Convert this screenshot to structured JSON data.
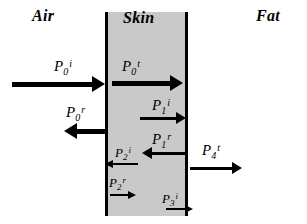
{
  "figure": {
    "background_color": "#ffffff",
    "ink_color": "#000000",
    "slab_fill_color": "#c9c9c9"
  },
  "regions": [
    {
      "id": "air",
      "label": "Air",
      "x": 32,
      "y": 7
    },
    {
      "id": "skin",
      "label": "Skin",
      "x": 123,
      "y": 9
    },
    {
      "id": "fat",
      "label": "Fat",
      "x": 256,
      "y": 7
    }
  ],
  "boundaries": [
    {
      "id": "air-skin",
      "x": 105,
      "top": 12,
      "height": 204,
      "thickness": 3
    },
    {
      "id": "skin-fat",
      "x": 185,
      "top": 12,
      "height": 204,
      "thickness": 3
    }
  ],
  "waves": [
    {
      "id": "p0-incident",
      "base": "P",
      "sub": "0",
      "sup": "i",
      "direction": "right",
      "weight": "thick",
      "arrow": {
        "x": 12,
        "y": 84,
        "length": 80
      },
      "label": {
        "x": 54,
        "y": 58
      }
    },
    {
      "id": "p0-transmitted",
      "base": "P",
      "sub": "0",
      "sup": "t",
      "direction": "right",
      "weight": "thick",
      "arrow": {
        "x": 112,
        "y": 83,
        "length": 58
      },
      "label": {
        "x": 122,
        "y": 58
      }
    },
    {
      "id": "p0-reflected",
      "base": "P",
      "sub": "0",
      "sup": "r",
      "direction": "left",
      "weight": "thick",
      "arrow": {
        "x": 77,
        "y": 131,
        "length": 28
      },
      "label": {
        "x": 66,
        "y": 104
      }
    },
    {
      "id": "p1-incident",
      "base": "P",
      "sub": "1",
      "sup": "i",
      "direction": "right",
      "weight": "med",
      "arrow": {
        "x": 140,
        "y": 118,
        "length": 36
      },
      "label": {
        "x": 152,
        "y": 97
      }
    },
    {
      "id": "p1-reflected",
      "base": "P",
      "sub": "1",
      "sup": "r",
      "direction": "left",
      "weight": "med",
      "arrow": {
        "x": 152,
        "y": 153,
        "length": 33
      },
      "label": {
        "x": 152,
        "y": 131
      }
    },
    {
      "id": "p2-incident",
      "base": "P",
      "sub": "2",
      "sup": "i",
      "direction": "left",
      "weight": "thin",
      "arrow": {
        "x": 113,
        "y": 164,
        "length": 25
      },
      "label": {
        "x": 115,
        "y": 144
      }
    },
    {
      "id": "p2-reflected",
      "base": "P",
      "sub": "2",
      "sup": "r",
      "direction": "right",
      "weight": "thin",
      "arrow": {
        "x": 110,
        "y": 195,
        "length": 18
      },
      "label": {
        "x": 109,
        "y": 174
      }
    },
    {
      "id": "p3-incident",
      "base": "P",
      "sub": "3",
      "sup": "i",
      "direction": "right",
      "weight": "thin",
      "arrow": {
        "x": 166,
        "y": 209,
        "length": 19
      },
      "label": {
        "x": 162,
        "y": 190
      }
    },
    {
      "id": "p4-transmitted",
      "base": "P",
      "sub": "4",
      "sup": "t",
      "direction": "right",
      "weight": "med",
      "arrow": {
        "x": 190,
        "y": 168,
        "length": 42
      },
      "label": {
        "x": 202,
        "y": 142
      }
    }
  ]
}
